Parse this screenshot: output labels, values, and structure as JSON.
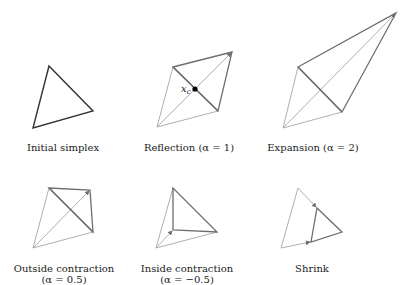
{
  "figure": {
    "panels": [
      {
        "id": "initial-simplex",
        "label": "Initial simplex",
        "label_lines": [
          "Initial simplex"
        ],
        "vertices": {
          "a": [
            49,
            66
          ],
          "b": [
            93,
            111
          ],
          "c": [
            33,
            128
          ]
        }
      },
      {
        "id": "reflection",
        "label": "Reflection (α = 1)",
        "label_lines": [
          "Reflection (α = 1)"
        ],
        "alpha": 1,
        "centroid_label": "x",
        "centroid_subscript": "c",
        "centroid": [
          195,
          89
        ],
        "vertices": {
          "a": [
            173,
            67
          ],
          "b": [
            218,
            111
          ],
          "c": [
            157,
            127
          ],
          "new": [
            232,
            52
          ]
        }
      },
      {
        "id": "expansion",
        "label": "Expansion (α = 2)",
        "label_lines": [
          "Expansion (α = 2)"
        ],
        "alpha": 2,
        "vertices": {
          "a": [
            298,
            67
          ],
          "b": [
            342,
            112
          ],
          "c": [
            283,
            128
          ],
          "new": [
            396,
            13
          ]
        }
      },
      {
        "id": "outside-contraction",
        "label": "Outside contraction (α = 0.5)",
        "label_lines": [
          "Outside contraction",
          "(α = 0.5)"
        ],
        "alpha": 0.5,
        "vertices": {
          "a": [
            49,
            188
          ],
          "b": [
            93,
            232
          ],
          "c": [
            33,
            248
          ],
          "new": [
            90,
            190
          ]
        }
      },
      {
        "id": "inside-contraction",
        "label": "Inside contraction (α = −0.5)",
        "label_lines": [
          "Inside contraction",
          "(α = −0.5)"
        ],
        "alpha": -0.5,
        "vertices": {
          "a": [
            173,
            188
          ],
          "b": [
            217,
            232
          ],
          "c": [
            156,
            248
          ],
          "new": [
            173,
            230
          ]
        }
      },
      {
        "id": "shrink",
        "label": "Shrink",
        "label_lines": [
          "Shrink"
        ],
        "vertices": {
          "a": [
            298,
            188
          ],
          "b": [
            342,
            232
          ],
          "c": [
            281,
            248
          ],
          "new1": [
            317,
            208
          ],
          "new2": [
            311,
            242
          ]
        }
      }
    ],
    "colors": {
      "simplex_initial": "#333333",
      "simplex_new": "#6e6e6e",
      "auxiliary": "#b0b0b0",
      "centroid": "#000000"
    }
  }
}
